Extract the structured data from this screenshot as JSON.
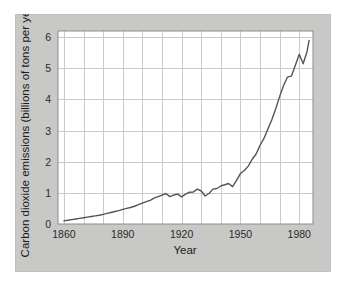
{
  "figure": {
    "background_color": "#ffffff",
    "panel_color": "#c8c8c6",
    "plot_area_color": "#ffffff",
    "grid_color": "#c9c9c9",
    "frame_color": "#8c8c8c",
    "line_color": "#555555",
    "text_color": "#2b2b2b"
  },
  "chart_data": {
    "type": "line",
    "title": "",
    "subtitle": "",
    "xlabel": "Year",
    "ylabel": "Carbon dioxide emissions (billions of tons per year)",
    "xlim": [
      1857,
      1987
    ],
    "ylim": [
      0,
      6.2
    ],
    "xticks": [
      1860,
      1890,
      1920,
      1950,
      1980
    ],
    "xtick_labels": [
      "1860",
      "1890",
      "1920",
      "1950",
      "1980"
    ],
    "yticks": [
      0,
      1,
      2,
      3,
      4,
      5,
      6
    ],
    "ytick_labels": [
      "0",
      "1",
      "2",
      "3",
      "4",
      "5",
      "6"
    ],
    "x_gridlines": [
      1860,
      1870,
      1880,
      1890,
      1900,
      1910,
      1920,
      1930,
      1940,
      1950,
      1960,
      1970,
      1980
    ],
    "y_gridlines": [
      1,
      2,
      3,
      4,
      5,
      6
    ],
    "grid": true,
    "legend": null,
    "legend_position": "none",
    "series": [
      {
        "name": "Carbon dioxide emissions",
        "x": [
          1860,
          1862,
          1864,
          1866,
          1868,
          1870,
          1872,
          1874,
          1876,
          1878,
          1880,
          1882,
          1884,
          1886,
          1888,
          1890,
          1892,
          1894,
          1896,
          1898,
          1900,
          1902,
          1904,
          1906,
          1908,
          1910,
          1912,
          1914,
          1916,
          1918,
          1920,
          1922,
          1924,
          1926,
          1928,
          1930,
          1932,
          1934,
          1936,
          1938,
          1940,
          1942,
          1944,
          1946,
          1948,
          1950,
          1952,
          1954,
          1956,
          1958,
          1960,
          1962,
          1964,
          1966,
          1968,
          1970,
          1972,
          1974,
          1976,
          1978,
          1980,
          1982,
          1984,
          1985
        ],
        "y": [
          0.1,
          0.12,
          0.14,
          0.16,
          0.18,
          0.2,
          0.22,
          0.24,
          0.26,
          0.28,
          0.31,
          0.34,
          0.37,
          0.4,
          0.43,
          0.47,
          0.5,
          0.53,
          0.57,
          0.62,
          0.67,
          0.72,
          0.76,
          0.83,
          0.88,
          0.93,
          0.98,
          0.88,
          0.93,
          0.96,
          0.87,
          0.96,
          1.02,
          1.03,
          1.12,
          1.06,
          0.9,
          0.98,
          1.12,
          1.14,
          1.22,
          1.26,
          1.3,
          1.2,
          1.4,
          1.62,
          1.72,
          1.86,
          2.08,
          2.25,
          2.53,
          2.75,
          3.05,
          3.35,
          3.7,
          4.1,
          4.45,
          4.72,
          4.75,
          5.1,
          5.45,
          5.15,
          5.55,
          5.9
        ],
        "color": "#555555",
        "line_width": 1.4
      }
    ],
    "annotations": []
  }
}
